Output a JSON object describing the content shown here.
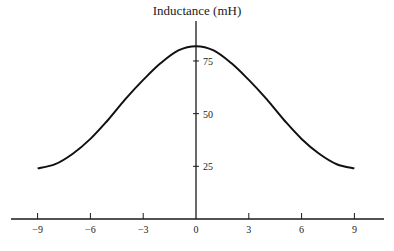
{
  "chart_data": {
    "type": "line",
    "title": "",
    "xlabel": "",
    "ylabel": "Inductance (mH)",
    "x_ticks": [
      -9,
      -6,
      -3,
      0,
      3,
      6,
      9
    ],
    "x_tick_labels": [
      "−9",
      "−6",
      "−3",
      "0",
      "3",
      "6",
      "9"
    ],
    "y_ticks": [
      25,
      50,
      75
    ],
    "y_tick_labels": [
      "25",
      "50",
      "75"
    ],
    "xlim": [
      -10.5,
      10.5
    ],
    "ylim": [
      0,
      93
    ],
    "grid": false,
    "legend": null,
    "series": [
      {
        "name": "Inductance",
        "x": [
          -9,
          -8,
          -7,
          -6,
          -5,
          -4,
          -3,
          -2,
          -1,
          0,
          1,
          2,
          3,
          4,
          5,
          6,
          7,
          8,
          9
        ],
        "y": [
          24,
          26,
          31,
          38,
          47,
          57,
          66,
          74,
          80,
          82,
          80,
          74,
          66,
          57,
          47,
          38,
          31,
          26,
          24
        ]
      }
    ]
  }
}
